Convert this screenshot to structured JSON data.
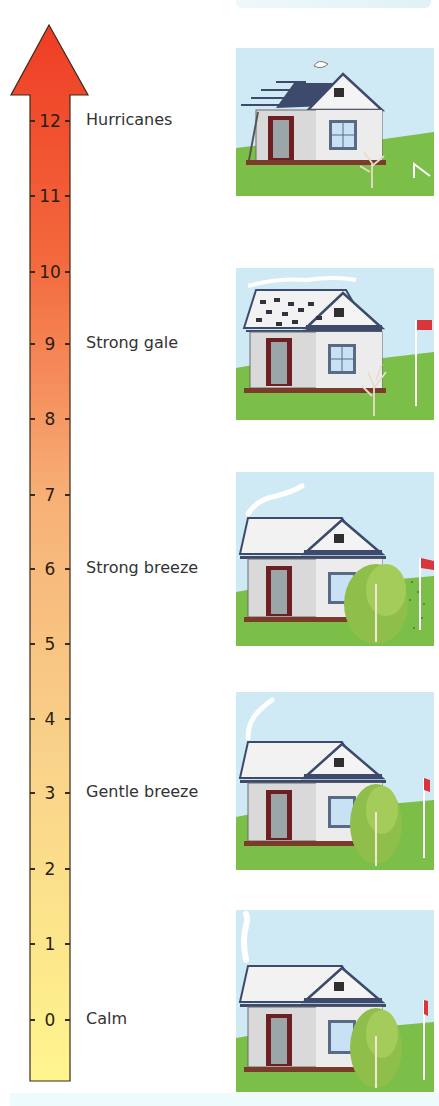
{
  "scale": {
    "min": 0,
    "max": 12,
    "ticks": [
      "0",
      "1",
      "2",
      "3",
      "4",
      "5",
      "6",
      "7",
      "8",
      "9",
      "10",
      "11",
      "12"
    ],
    "tick_y": [
      1019,
      943,
      868,
      792,
      718,
      643,
      568,
      494,
      418,
      343,
      271,
      195,
      120
    ],
    "gradient_colors": {
      "top": "#ee3d24",
      "middle": "#f8b57a",
      "bottom": "#fff48a"
    }
  },
  "levels": [
    {
      "force": "12",
      "label": "Hurricanes",
      "y": 120,
      "scene": "roof-torn-off-tree-bent-flag-gone"
    },
    {
      "force": "9",
      "label": "Strong gale",
      "y": 343,
      "scene": "shingles-blown-smoke-horizontal-flag-extended"
    },
    {
      "force": "6",
      "label": "Strong breeze",
      "y": 568,
      "scene": "tree-swaying-smoke-curved-flag-flying"
    },
    {
      "force": "3",
      "label": "Gentle breeze",
      "y": 792,
      "scene": "tree-leafy-smoke-slanted-flag-slight"
    },
    {
      "force": "0",
      "label": "Calm",
      "y": 1019,
      "scene": "smoke-vertical-flag-hanging"
    }
  ],
  "colors": {
    "sky": "#cde9f5",
    "grass": "#7fc24a",
    "house_wall": "#dcdcdc",
    "roof": "#f2f2f2",
    "roof_dark": "#3d4a6b",
    "door": "#6e1f23",
    "flag": "#d9353a",
    "tree": "#8fbf4a"
  }
}
